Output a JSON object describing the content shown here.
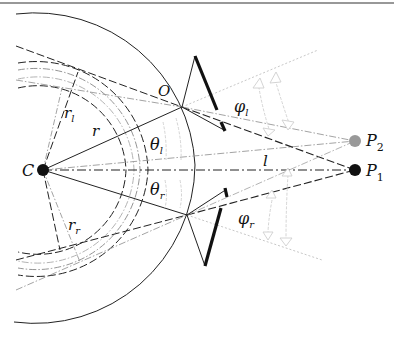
{
  "diagram": {
    "type": "geometry-diagram",
    "labels": {
      "center": "C",
      "contact_point": "O",
      "radius": "r",
      "radius_left_base": "r",
      "radius_left_sub": "l",
      "radius_right_base": "r",
      "radius_right_sub": "r",
      "theta_left_base": "θ",
      "theta_left_sub": "l",
      "theta_right_base": "θ",
      "theta_right_sub": "r",
      "phi_left_base": "φ",
      "phi_left_sub": "l",
      "phi_right_base": "φ",
      "phi_right_sub": "r",
      "distance": "l",
      "point1_base": "P",
      "point1_sub": "1",
      "point2_base": "P",
      "point2_sub": "2"
    },
    "colors": {
      "ink": "#111111",
      "mid_gray": "#888888",
      "light_gray": "#c8c8c8",
      "p2_fill": "#999999",
      "p1_fill": "#111111"
    },
    "nodes": [
      {
        "id": "C",
        "x": 43,
        "y": 170
      },
      {
        "id": "O",
        "x": 182,
        "y": 107
      },
      {
        "id": "O_lower",
        "x": 187,
        "y": 215
      },
      {
        "id": "P1",
        "x": 355,
        "y": 170
      },
      {
        "id": "P2",
        "x": 355,
        "y": 141
      }
    ]
  }
}
